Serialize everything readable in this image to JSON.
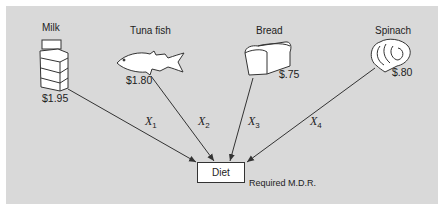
{
  "items": [
    {
      "name": "Milk",
      "price": "$1.95",
      "variable": "X",
      "subscript": "1",
      "icon": "milk-carton-icon"
    },
    {
      "name": "Tuna fish",
      "price": "$1.80",
      "variable": "X",
      "subscript": "2",
      "icon": "fish-icon"
    },
    {
      "name": "Bread",
      "price": "$.75",
      "variable": "X",
      "subscript": "3",
      "icon": "bread-loaf-icon"
    },
    {
      "name": "Spinach",
      "price": "$.80",
      "variable": "X",
      "subscript": "4",
      "icon": "spinach-icon"
    }
  ],
  "target": {
    "label": "Diet",
    "constraint_label": "Required M.D.R."
  },
  "colors": {
    "panel_background": "#d9d9d9",
    "line": "#333333",
    "box_fill": "#ffffff"
  }
}
